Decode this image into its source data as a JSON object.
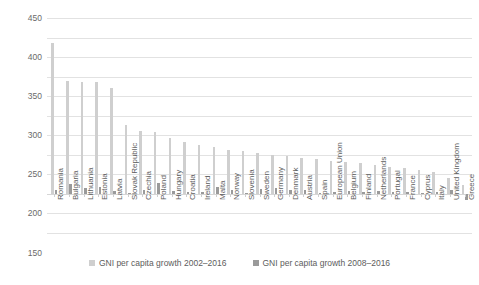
{
  "chart_data": {
    "type": "bar",
    "title": "",
    "subtitle": "",
    "xlabel": "",
    "ylabel": "",
    "ylim": [
      -100,
      450
    ],
    "ytick_step": 50,
    "yticks": [
      450,
      400,
      350,
      300,
      250,
      200,
      150,
      100,
      50,
      0,
      -50,
      -100
    ],
    "grid": true,
    "legend_position": "bottom",
    "categories": [
      "Romania",
      "Bulgaria",
      "Lithuania",
      "Estonia",
      "Latvia",
      "Slovak Republic",
      "Czechia",
      "Poland",
      "Hungary",
      "Croatia",
      "Ireland",
      "Malta",
      "Norway",
      "Slovenia",
      "Sweden",
      "Germany",
      "Denmark",
      "Austria",
      "Spain",
      "European Union",
      "Belgium",
      "Finland",
      "Netherlands",
      "Portugal",
      "France",
      "Cyprus",
      "Italy",
      "United Kingdom",
      "Greece"
    ],
    "series": [
      {
        "name": "GNI per capita growth 2002–2016",
        "color": "#cfcfcf",
        "values": [
          385,
          288,
          287,
          287,
          270,
          176,
          162,
          159,
          143,
          133,
          125,
          119,
          112,
          110,
          104,
          100,
          97,
          93,
          89,
          85,
          82,
          79,
          75,
          70,
          66,
          61,
          55,
          40,
          22
        ]
      },
      {
        "name": "GNI per capita growth 2008–2016",
        "color": "#9a9a9a",
        "values": [
          10,
          25,
          14,
          18,
          8,
          3,
          11,
          28,
          8,
          5,
          6,
          17,
          9,
          2,
          13,
          16,
          10,
          9,
          3,
          6,
          8,
          4,
          7,
          5,
          6,
          3,
          4,
          9,
          -16
        ]
      }
    ]
  },
  "legend": {
    "items": [
      {
        "label": "GNI per capita growth 2002–2016",
        "series": 0
      },
      {
        "label": "GNI per capita growth 2008–2016",
        "series": 1
      }
    ]
  }
}
